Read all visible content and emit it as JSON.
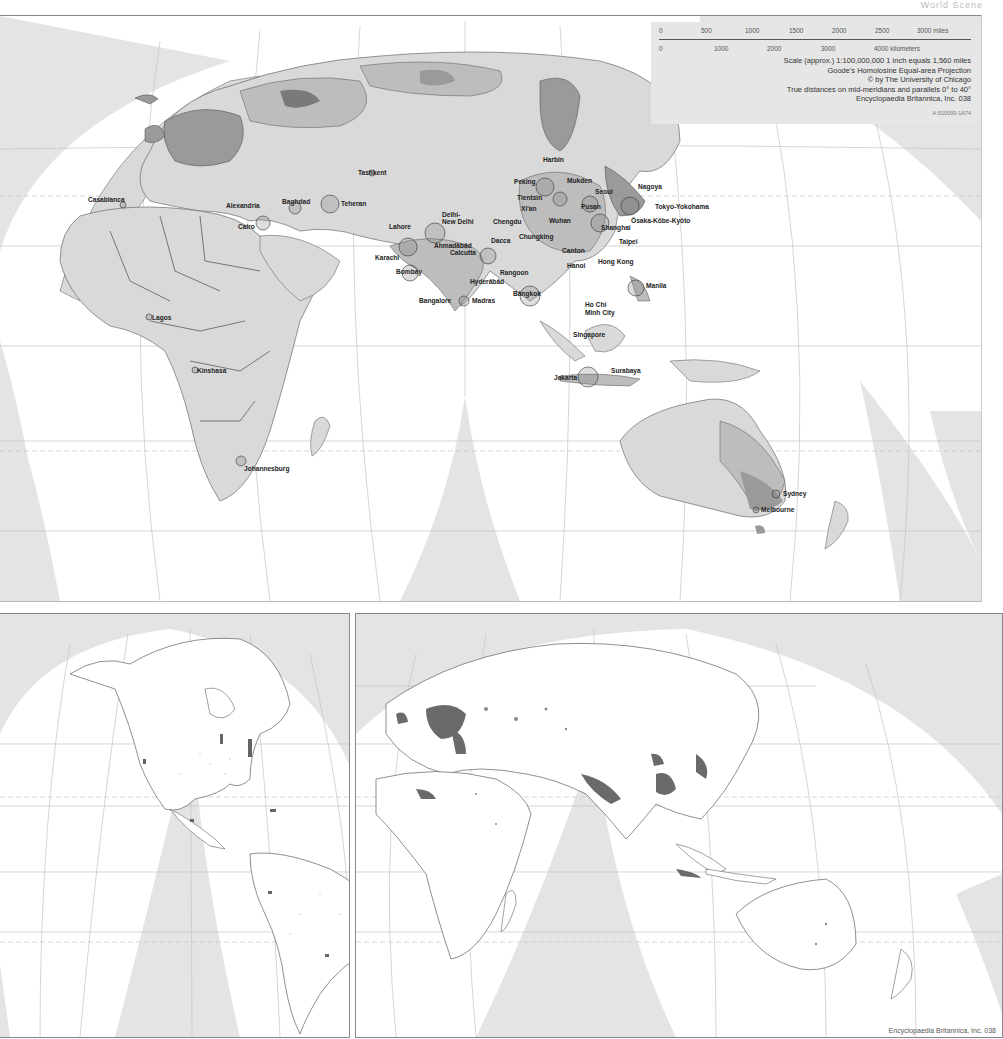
{
  "header": {
    "title": "World Scene"
  },
  "scale_box": {
    "miles_ticks": [
      "0",
      "500",
      "1000",
      "1500",
      "2000",
      "2500",
      "3000 miles"
    ],
    "km_ticks": [
      "0",
      "1000",
      "2000",
      "3000",
      "4000 kilometers"
    ],
    "scale_line": "Scale (approx.) 1:100,000,000   1 inch equals 1,560 miles",
    "projection": "Goode's Homolosine Equal-area Projection",
    "copyright": "© by The University of Chicago",
    "true_distances": "True distances on mid-meridians and parallels 0° to 40°",
    "publisher": "Encyclopaedia Britannica, Inc. 038",
    "code": "A-510000-1A74"
  },
  "main_map": {
    "cities": [
      {
        "name": "Tashkent",
        "x": 358,
        "y": 172
      },
      {
        "name": "Casablanca",
        "x": 88,
        "y": 199
      },
      {
        "name": "Alexandria",
        "x": 226,
        "y": 205
      },
      {
        "name": "Baghdad",
        "x": 282,
        "y": 201
      },
      {
        "name": "Teheran",
        "x": 341,
        "y": 203
      },
      {
        "name": "Cairo",
        "x": 238,
        "y": 226
      },
      {
        "name": "Lahore",
        "x": 389,
        "y": 226
      },
      {
        "name": "Delhi-",
        "x": 442,
        "y": 214
      },
      {
        "name": "New Delhi",
        "x": 442,
        "y": 221
      },
      {
        "name": "Karachi",
        "x": 375,
        "y": 257
      },
      {
        "name": "Ahmadābād",
        "x": 434,
        "y": 245
      },
      {
        "name": "Calcutta",
        "x": 450,
        "y": 252
      },
      {
        "name": "Dacca",
        "x": 491,
        "y": 240
      },
      {
        "name": "Bombay",
        "x": 396,
        "y": 271
      },
      {
        "name": "Hyderābād",
        "x": 470,
        "y": 281
      },
      {
        "name": "Bangalore",
        "x": 419,
        "y": 300
      },
      {
        "name": "Madras",
        "x": 472,
        "y": 300
      },
      {
        "name": "Harbin",
        "x": 543,
        "y": 159
      },
      {
        "name": "Peking",
        "x": 514,
        "y": 181
      },
      {
        "name": "Mukden",
        "x": 567,
        "y": 180
      },
      {
        "name": "Tientsin",
        "x": 517,
        "y": 197
      },
      {
        "name": "Seoul",
        "x": 595,
        "y": 191
      },
      {
        "name": "Pusan",
        "x": 581,
        "y": 206
      },
      {
        "name": "Nagoya",
        "x": 638,
        "y": 186
      },
      {
        "name": "Tokyo-Yokohama",
        "x": 655,
        "y": 206
      },
      {
        "name": "Ōsaka-Kōbe-Kyōto",
        "x": 631,
        "y": 220
      },
      {
        "name": "Xi'an",
        "x": 521,
        "y": 208
      },
      {
        "name": "Chengdu",
        "x": 493,
        "y": 221
      },
      {
        "name": "Wuhan",
        "x": 549,
        "y": 220
      },
      {
        "name": "Shanghai",
        "x": 601,
        "y": 227
      },
      {
        "name": "Chungking",
        "x": 519,
        "y": 236
      },
      {
        "name": "Taipei",
        "x": 619,
        "y": 241
      },
      {
        "name": "Canton",
        "x": 562,
        "y": 250
      },
      {
        "name": "Hong Kong",
        "x": 598,
        "y": 261
      },
      {
        "name": "Hanoi",
        "x": 567,
        "y": 265
      },
      {
        "name": "Rangoon",
        "x": 500,
        "y": 272
      },
      {
        "name": "Manila",
        "x": 646,
        "y": 285
      },
      {
        "name": "Bāngkok",
        "x": 513,
        "y": 293
      },
      {
        "name": "Ho Chi",
        "x": 585,
        "y": 304
      },
      {
        "name": "Minh City",
        "x": 585,
        "y": 312
      },
      {
        "name": "Singapore",
        "x": 573,
        "y": 334
      },
      {
        "name": "Surabaya",
        "x": 611,
        "y": 370
      },
      {
        "name": "Jakarta",
        "x": 554,
        "y": 377
      },
      {
        "name": "Lagos",
        "x": 152,
        "y": 317
      },
      {
        "name": "Kinshasa",
        "x": 197,
        "y": 370
      },
      {
        "name": "Johannesburg",
        "x": 244,
        "y": 468
      },
      {
        "name": "Sydney",
        "x": 783,
        "y": 493
      },
      {
        "name": "Melbourne",
        "x": 761,
        "y": 509
      }
    ]
  },
  "americas_map": {
    "label": "Americas population distribution"
  },
  "eastern_map": {
    "label": "Eastern hemisphere population distribution"
  },
  "footer": {
    "credit": "Encyclopaedia Britannica, Inc. 038"
  },
  "colors": {
    "ocean": "#ffffff",
    "interrupt": "#e4e4e4",
    "land_light": "#d9d9d9",
    "land_mid": "#bdbdbd",
    "land_dark": "#9a9a9a",
    "land_darkest": "#7a7a7a",
    "border": "#333333",
    "grid": "#bbbbbb"
  }
}
